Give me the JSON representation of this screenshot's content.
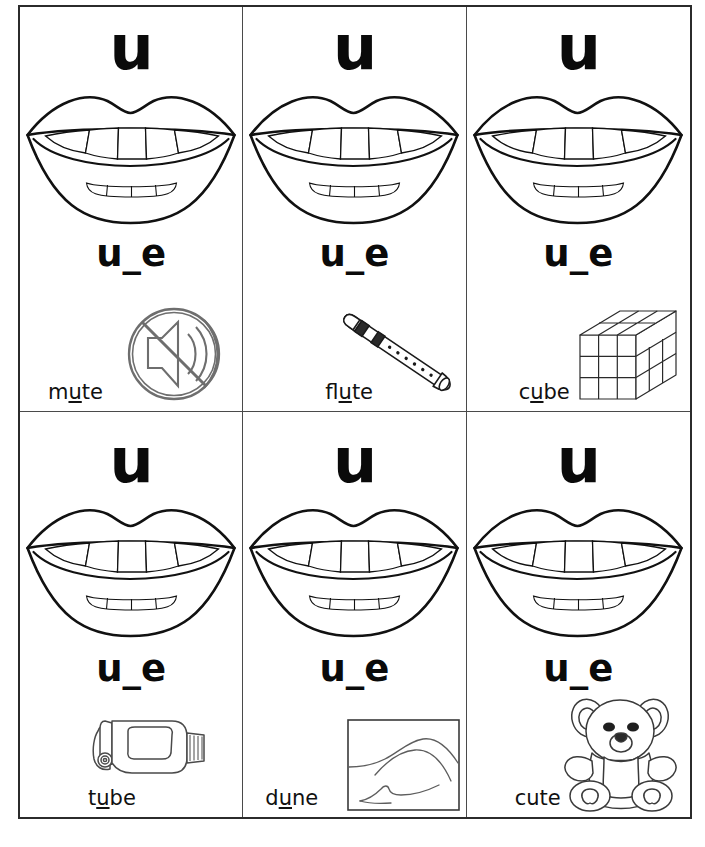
{
  "worksheet": {
    "vowel_letter": "u",
    "pattern": "u_e",
    "background_color": "#ffffff",
    "ink_color": "#111111",
    "grid": {
      "columns": 3,
      "rows": 2
    }
  },
  "cards": [
    {
      "id": "card-mute",
      "letter": "u",
      "pattern": "u_e",
      "word": "mute",
      "word_prefix": "m",
      "word_vowel": "u",
      "word_suffix": "te",
      "picture_name": "mute-speaker-icon",
      "mouth_name": "open-mouth-diagram"
    },
    {
      "id": "card-flute",
      "letter": "u",
      "pattern": "u_e",
      "word": "flute",
      "word_prefix": "fl",
      "word_vowel": "u",
      "word_suffix": "te",
      "picture_name": "flute-icon",
      "mouth_name": "open-mouth-diagram"
    },
    {
      "id": "card-cube",
      "letter": "u",
      "pattern": "u_e",
      "word": "cube",
      "word_prefix": "c",
      "word_vowel": "u",
      "word_suffix": "be",
      "picture_name": "cube-icon",
      "mouth_name": "open-mouth-diagram"
    },
    {
      "id": "card-tube",
      "letter": "u",
      "pattern": "u_e",
      "word": "tube",
      "word_prefix": "t",
      "word_vowel": "u",
      "word_suffix": "be",
      "picture_name": "toothpaste-tube-icon",
      "mouth_name": "open-mouth-diagram"
    },
    {
      "id": "card-dune",
      "letter": "u",
      "pattern": "u_e",
      "word": "dune",
      "word_prefix": "d",
      "word_vowel": "u",
      "word_suffix": "ne",
      "picture_name": "sand-dune-picture",
      "mouth_name": "open-mouth-diagram"
    },
    {
      "id": "card-cute",
      "letter": "u",
      "pattern": "u_e",
      "word": "cute",
      "word_prefix": "cute",
      "word_vowel": "",
      "word_suffix": "",
      "picture_name": "teddy-bear-icon",
      "mouth_name": "open-mouth-diagram"
    }
  ]
}
